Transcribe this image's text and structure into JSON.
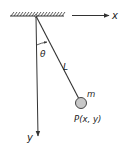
{
  "diagram": {
    "labels": {
      "x_axis": "x",
      "y_axis": "y",
      "angle": "θ",
      "length": "L",
      "mass": "m",
      "point": "P(x, y)"
    },
    "colors": {
      "line": "#333333",
      "bob_fill": "#c8c8c8",
      "bob_stroke": "#444444",
      "text": "#222222"
    }
  }
}
